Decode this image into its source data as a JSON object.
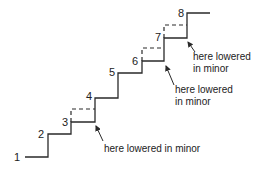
{
  "diagram": {
    "type": "scale-staircase",
    "colors": {
      "line": "#2a2a2a",
      "text": "#222222",
      "background": "#ffffff"
    },
    "steps": [
      {
        "label": "1",
        "x1": 25,
        "x2": 48,
        "y": 157,
        "lx": 14,
        "ly": 161
      },
      {
        "label": "2",
        "x1": 48,
        "x2": 71,
        "y": 134,
        "lx": 38,
        "ly": 138
      },
      {
        "label": "3",
        "x1": 71,
        "x2": 95,
        "y": 122,
        "lx": 62,
        "ly": 126
      },
      {
        "label": "4",
        "x1": 95,
        "x2": 118,
        "y": 98,
        "lx": 86,
        "ly": 100
      },
      {
        "label": "5",
        "x1": 118,
        "x2": 142,
        "y": 73,
        "lx": 109,
        "ly": 76
      },
      {
        "label": "6",
        "x1": 142,
        "x2": 164,
        "y": 61,
        "lx": 132,
        "ly": 65
      },
      {
        "label": "7",
        "x1": 164,
        "x2": 187,
        "y": 38,
        "lx": 155,
        "ly": 41
      },
      {
        "label": "8",
        "x1": 187,
        "x2": 210,
        "y": 13,
        "lx": 178,
        "ly": 17
      }
    ],
    "lowered_notes": [
      {
        "step": "3",
        "lines": [
          "here lowered in minor"
        ],
        "text_x": 104,
        "text_y": 152,
        "arrow": {
          "x1": 103,
          "y1": 141,
          "x2": 96,
          "y2": 126
        }
      },
      {
        "step": "6",
        "lines": [
          "here lowered",
          "in minor"
        ],
        "text_x": 175,
        "text_y": 93,
        "arrow": {
          "x1": 174,
          "y1": 85,
          "x2": 166,
          "y2": 66
        }
      },
      {
        "step": "7",
        "lines": [
          "here lowered",
          "in minor"
        ],
        "text_x": 193,
        "text_y": 60,
        "arrow": {
          "x1": 195,
          "y1": 52,
          "x2": 188,
          "y2": 42
        }
      }
    ],
    "dashed_raised": [
      {
        "x1": 71,
        "x2": 95,
        "y_low": 122,
        "y_high": 109
      },
      {
        "x1": 142,
        "x2": 164,
        "y_low": 61,
        "y_high": 48
      },
      {
        "x1": 164,
        "x2": 187,
        "y_low": 38,
        "y_high": 25
      }
    ]
  }
}
